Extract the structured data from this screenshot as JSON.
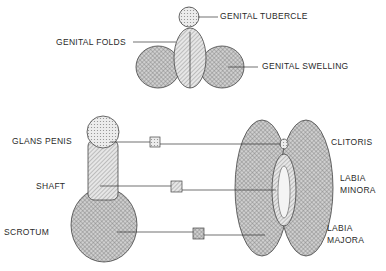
{
  "colors": {
    "ink": "#2a2a2a",
    "fill_light": "#d9d9d9",
    "fill_dark": "#9a9a9a",
    "background": "#ffffff"
  },
  "top_structure": {
    "labels": {
      "tubercle": "GENITAL TUBERCLE",
      "folds": "GENITAL FOLDS",
      "swelling": "GENITAL SWELLING"
    }
  },
  "left_structure": {
    "labels": {
      "head": "GLANS PENIS",
      "shaft": "SHAFT",
      "sac": "SCROTUM"
    }
  },
  "right_structure": {
    "labels": {
      "top": "CLITORIS",
      "inner_1": "LABIA",
      "inner_2": "MINORA",
      "outer_1": "LABIA",
      "outer_2": "MAJORA"
    }
  },
  "legend_keys": [
    {
      "name": "tubercle-derived",
      "pattern": "dots-light"
    },
    {
      "name": "folds-derived",
      "pattern": "hatch"
    },
    {
      "name": "swelling-derived",
      "pattern": "crosshatch"
    }
  ]
}
